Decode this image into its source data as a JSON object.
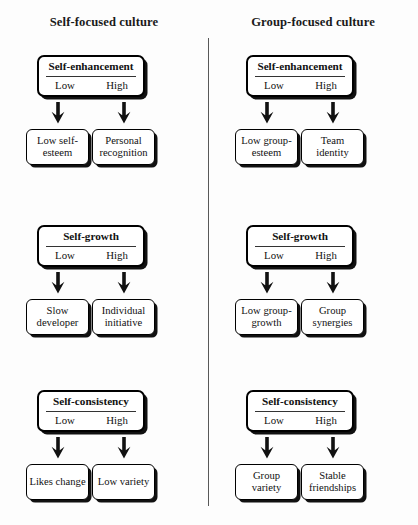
{
  "columns": [
    {
      "id": "self-focused",
      "title": "Self-focused culture"
    },
    {
      "id": "group-focused",
      "title": "Group-focused culture"
    }
  ],
  "levels": {
    "low": "Low",
    "high": "High"
  },
  "groups": [
    {
      "construct": "Self-enhancement",
      "left": {
        "low_outcome": "Low self-esteem",
        "high_outcome": "Personal recognition"
      },
      "right": {
        "low_outcome": "Low group-esteem",
        "high_outcome": "Team identity"
      }
    },
    {
      "construct": "Self-growth",
      "left": {
        "low_outcome": "Slow developer",
        "high_outcome": "Individual initiative"
      },
      "right": {
        "low_outcome": "Low group-growth",
        "high_outcome": "Group synergies"
      }
    },
    {
      "construct": "Self-consistency",
      "left": {
        "low_outcome": "Likes change",
        "high_outcome": "Low variety"
      },
      "right": {
        "low_outcome": "Group variety",
        "high_outcome": "Stable friendships"
      }
    }
  ],
  "style": {
    "background": "#fdfdfd",
    "ink": "#000000",
    "divider": "#585858"
  }
}
